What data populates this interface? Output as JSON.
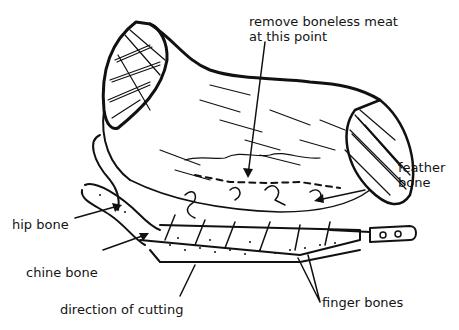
{
  "diagram": {
    "labels": {
      "remove_meat_line1": "remove boneless meat",
      "remove_meat_line2": "at this point",
      "feather_bone_line1": "feather",
      "feather_bone_line2": "bone",
      "hip_bone": "hip bone",
      "chine_bone": "chine bone",
      "direction": "direction of cutting",
      "finger_bones": "finger bones"
    },
    "colors": {
      "ink": "#111111",
      "background": "#ffffff"
    }
  }
}
